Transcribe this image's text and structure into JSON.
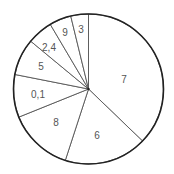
{
  "chart_data": {
    "type": "pie",
    "title": "",
    "start_angle_deg": 0,
    "direction": "clockwise",
    "categories": [
      "7",
      "6",
      "8",
      "0,1",
      "5",
      "2,4",
      "9",
      "3"
    ],
    "values": [
      37.2,
      17.8,
      13.9,
      9.2,
      7.9,
      5.5,
      4.7,
      3.8
    ],
    "label_positions": [
      [
        124,
        80
      ],
      [
        97,
        136
      ],
      [
        56,
        123
      ],
      [
        38,
        95
      ],
      [
        41,
        67
      ],
      [
        49,
        48
      ],
      [
        65,
        33
      ],
      [
        81,
        30
      ]
    ],
    "legend": "none",
    "colors": {
      "fill": "#ffffff",
      "slice_line": "#555555",
      "rim": "#222222",
      "label": "#555555"
    }
  }
}
